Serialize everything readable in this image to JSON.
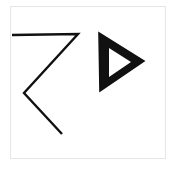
{
  "canvas": {
    "width": 179,
    "height": 173,
    "background_color": "#ffffff",
    "description": "Hand-drawn black symbols on a white card"
  },
  "card": {
    "name": "symbol-card",
    "background_color": "#ffffff",
    "border_color": "#e6e6e8",
    "x": 10,
    "y": 6,
    "width": 156,
    "height": 153
  },
  "symbols": [
    {
      "id": "zigzag",
      "label": "Z-shaped zigzag stroke",
      "type": "polyline",
      "stroke_color": "#111111",
      "stroke_width": 2.4,
      "fill": "none",
      "points": "12,35 78,34 24,93 62,134"
    },
    {
      "id": "triangle",
      "label": "Right-pointing hollow triangle",
      "type": "polygon-outline",
      "stroke_color": "#111111",
      "fill_color": "#111111",
      "inner_fill_color": "#ffffff",
      "outer_points": "99,33 144,61 100,91",
      "inner_points": "109,48 131,62 109,77"
    }
  ]
}
